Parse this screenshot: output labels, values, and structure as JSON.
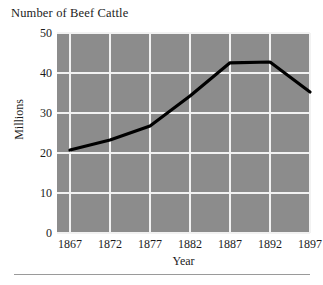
{
  "chart_data": {
    "type": "line",
    "title": "Number of Beef Cattle",
    "xlabel": "Year",
    "ylabel": "Millions",
    "categories": [
      "1867",
      "1872",
      "1877",
      "1882",
      "1887",
      "1892",
      "1897"
    ],
    "x": [
      1867,
      1872,
      1877,
      1882,
      1887,
      1892,
      1897
    ],
    "values": [
      20.5,
      23,
      26.5,
      34,
      42.3,
      42.5,
      35
    ],
    "series": [
      {
        "name": "Beef Cattle",
        "values": [
          20.5,
          23,
          26.5,
          34,
          42.3,
          42.5,
          35
        ]
      }
    ],
    "xlim": [
      1867,
      1897
    ],
    "ylim": [
      0,
      50
    ],
    "ytick_labels": [
      "0",
      "10",
      "20",
      "30",
      "40",
      "50"
    ],
    "ytick_values": [
      0,
      10,
      20,
      30,
      40,
      50
    ],
    "xtick_labels": [
      "1867",
      "1872",
      "1877",
      "1882",
      "1887",
      "1892",
      "1897"
    ],
    "grid": true,
    "legend": "none",
    "plot_background_color": "#8c8c8c",
    "gridline_color": "#f2f2f2",
    "line_color": "#000000",
    "text_color": "#1c1c1c"
  }
}
